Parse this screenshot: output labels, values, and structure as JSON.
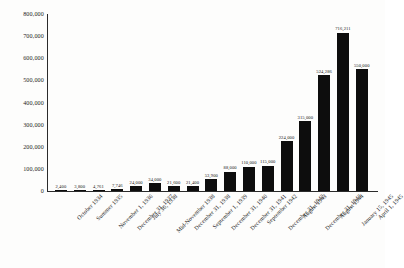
{
  "chart_data": {
    "type": "bar",
    "title": "",
    "xlabel": "",
    "ylabel": "",
    "ylim": [
      0,
      800000
    ],
    "grid": false,
    "legend": null,
    "y_ticks": [
      "800,000",
      "700,000",
      "600,000",
      "500,000",
      "400,000",
      "300,000",
      "200,000",
      "100,000",
      "0"
    ],
    "y_tick_values": [
      800000,
      700000,
      600000,
      500000,
      400000,
      300000,
      200000,
      100000,
      0
    ],
    "categories": [
      "October 1934",
      "Summer 1935",
      "November 1, 1936",
      "December 31, 1937",
      "July 30, 1938",
      "Mid-November 1938",
      "December 31, 1938",
      "September 1, 1939",
      "December 31, 1940",
      "December 31, 1941",
      "September 1942",
      "December 31, 1942",
      "August 1943",
      "December 31, 1943",
      "August 1944",
      "January 15, 1945",
      "April 1, 1945"
    ],
    "values": [
      2400,
      3800,
      4761,
      7746,
      24000,
      34000,
      21600,
      21400,
      53900,
      88000,
      110000,
      115000,
      224000,
      315000,
      524286,
      716211,
      550000
    ],
    "value_labels": [
      "2,400",
      "3,800",
      "4,761",
      "7,746",
      "24,000",
      "34,000",
      "21,600",
      "21,400",
      "53,900",
      "88,000",
      "110,000",
      "115,000",
      "224,000",
      "315,000",
      "524,286",
      "716,211",
      "550,000"
    ],
    "bar_color": "#0d0d0d",
    "background_color": "#fdfdfc",
    "axis_color": "#2b2b2b"
  }
}
